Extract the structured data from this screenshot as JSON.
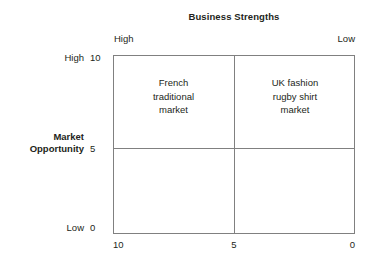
{
  "chart_data": {
    "type": "table",
    "title": "Business Strengths",
    "xlabel": "Business Strengths",
    "ylabel": "Market Opportunity",
    "grid": true,
    "legend": "none",
    "x_axis": {
      "title": "Business Strengths",
      "high_label": "High",
      "low_label": "Low",
      "ticks": [
        "10",
        "5",
        "0"
      ],
      "range": [
        10,
        0
      ],
      "direction": "reversed"
    },
    "y_axis": {
      "title": "Market Opportunity",
      "high_label": "High",
      "low_label": "Low",
      "ticks": [
        "10",
        "5",
        "0"
      ],
      "range": [
        0,
        10
      ]
    },
    "quadrants": [
      {
        "position": "top-left",
        "x_range": [
          10,
          5
        ],
        "y_range": [
          5,
          10
        ],
        "label": "French\ntraditional\nmarket",
        "lines": [
          "French",
          "traditional",
          "market"
        ]
      },
      {
        "position": "top-right",
        "x_range": [
          5,
          0
        ],
        "y_range": [
          5,
          10
        ],
        "label": "UK fashion\nrugby shirt\nmarket",
        "lines": [
          "UK fashion",
          "rugby shirt",
          "market"
        ]
      },
      {
        "position": "bottom-left",
        "x_range": [
          10,
          5
        ],
        "y_range": [
          0,
          5
        ],
        "label": "",
        "lines": []
      },
      {
        "position": "bottom-right",
        "x_range": [
          5,
          0
        ],
        "y_range": [
          0,
          5
        ],
        "label": "",
        "lines": []
      }
    ]
  },
  "title": "Business Strengths",
  "top_axis": {
    "high": "High",
    "low": "Low"
  },
  "y_axis_labels": {
    "high_word": "High",
    "high_num": "10",
    "mid_word_line1": "Market",
    "mid_word_line2": "Opportunity",
    "mid_num": "5",
    "low_word": "Low",
    "low_num": "0"
  },
  "x_axis_labels": {
    "tick_left": "10",
    "tick_mid": "5",
    "tick_right": "0"
  },
  "quadrant_tl": {
    "line1": "French",
    "line2": "traditional",
    "line3": "market"
  },
  "quadrant_tr": {
    "line1": "UK fashion",
    "line2": "rugby shirt",
    "line3": "market"
  },
  "colors": {
    "background": "#ffffff",
    "border": "#808080",
    "text": "#231f20"
  }
}
